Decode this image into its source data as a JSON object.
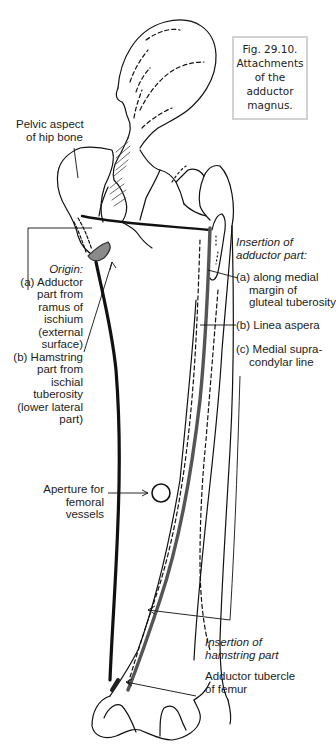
{
  "figure": {
    "caption_lines": [
      "Fig. 29.10.",
      "Attachments",
      "of the",
      "adductor",
      "magnus."
    ],
    "title": "Fig. 29.10. Attachments of the adductor magnus."
  },
  "labels": {
    "pelvic": [
      "Pelvic aspect",
      "of hip bone"
    ],
    "origin": {
      "heading": "Origin:",
      "lines": [
        "(a) Adductor",
        "part from",
        "ramus of",
        "ischium",
        "(external",
        "surface)",
        "(b) Hamstring",
        "part from",
        "ischial",
        "tuberosity",
        "(lower lateral",
        "part)"
      ]
    },
    "insertion_adductor": {
      "heading": [
        "Insertion of",
        "adductor part:"
      ],
      "a": [
        "(a) along medial",
        "margin of",
        "gluteal tuberosity"
      ],
      "b": [
        "(b) Linea aspera"
      ],
      "c": [
        "(c) Medial supra-",
        "condylar line"
      ]
    },
    "aperture": [
      "Aperture for",
      "femoral",
      "vessels"
    ],
    "insertion_hamstring": [
      "Insertion of",
      "hamstring part"
    ],
    "adductor_tubercle": [
      "Adductor tubercle",
      "of femur"
    ]
  },
  "colors": {
    "line": "#111111",
    "muscle_edge": "#555555",
    "caption_border": "#d2d2d2",
    "shading": "#8a8a8a"
  }
}
